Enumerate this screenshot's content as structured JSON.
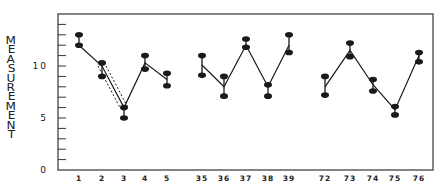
{
  "chart_data": {
    "type": "line",
    "title": "",
    "xlabel": "",
    "ylabel": "MEASUREMENT",
    "ylim": [
      0,
      15
    ],
    "yticks": [
      0,
      5,
      10
    ],
    "y_minor_tick_step": 1,
    "grid": false,
    "legend": null,
    "categories": [
      "1",
      "2",
      "3",
      "4",
      "5",
      "35",
      "36",
      "37",
      "38",
      "39",
      "72",
      "73",
      "74",
      "75",
      "76"
    ],
    "groups": [
      {
        "categories": [
          "1",
          "2",
          "3",
          "4",
          "5"
        ]
      },
      {
        "categories": [
          "35",
          "36",
          "37",
          "38",
          "39"
        ]
      },
      {
        "categories": [
          "72",
          "73",
          "74",
          "75",
          "76"
        ]
      }
    ],
    "series": [
      {
        "name": "upper",
        "values": [
          13.0,
          10.3,
          6.0,
          11.0,
          9.3,
          11.0,
          9.0,
          12.6,
          8.2,
          13.0,
          9.0,
          12.2,
          8.7,
          6.1,
          11.3
        ]
      },
      {
        "name": "lower",
        "values": [
          12.0,
          9.0,
          5.0,
          9.7,
          8.1,
          9.1,
          7.1,
          11.8,
          7.1,
          11.3,
          7.2,
          10.9,
          7.6,
          5.3,
          10.4
        ]
      },
      {
        "name": "connecting line",
        "values": [
          12.0,
          10.0,
          6.0,
          10.3,
          8.7,
          10.1,
          8.0,
          12.0,
          8.0,
          12.0,
          8.0,
          11.5,
          8.2,
          5.8,
          11.0
        ]
      }
    ],
    "annotations": [
      {
        "type": "dashed-band",
        "from": "2",
        "to": "3",
        "note": "two dotted lines flanking the segment from point 2 to point 3"
      }
    ]
  },
  "axis": {
    "ytick_labels": [
      "0",
      "5",
      "10"
    ],
    "ylabel_letters": [
      "M",
      "E",
      "A",
      "S",
      "U",
      "R",
      "E",
      "M",
      "E",
      "N",
      "T"
    ]
  }
}
